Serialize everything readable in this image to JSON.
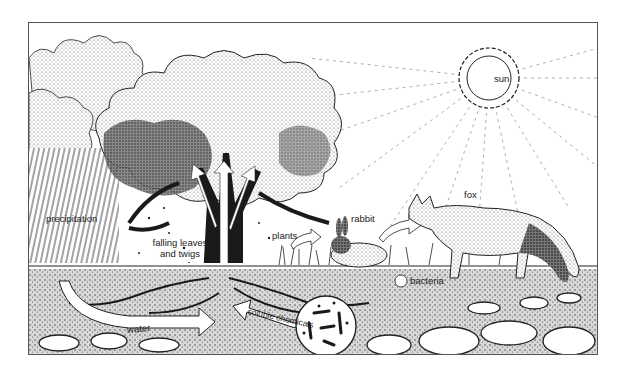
{
  "diagram": {
    "type": "ecosystem nutrient cycle illustration",
    "labels": {
      "sun": "sun",
      "fox": "fox",
      "rabbit": "rabbit",
      "plants": "plants",
      "precipitation": "precipitation",
      "falling_leaves_line1": "falling leaves",
      "falling_leaves_line2": "and twigs",
      "bacteria": "bacteria",
      "water": "water",
      "soluble_chemicals": "soluble chemicals"
    },
    "flows": [
      {
        "from": "precipitation",
        "to": "tree roots",
        "label": "water"
      },
      {
        "from": "bacteria",
        "to": "tree roots",
        "label": "soluble chemicals"
      },
      {
        "from": "tree roots",
        "to": "tree canopy",
        "label": ""
      },
      {
        "from": "plants",
        "to": "rabbit",
        "label": ""
      },
      {
        "from": "rabbit",
        "to": "fox",
        "label": ""
      }
    ],
    "colors": {
      "ink": "#1a1a1a",
      "background": "#ffffff",
      "frame": "#555555"
    }
  }
}
